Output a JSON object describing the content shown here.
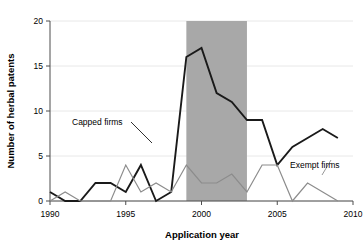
{
  "chart_data": {
    "type": "line",
    "title": "",
    "xlabel": "Application year",
    "ylabel": "Number of herbal patents",
    "xlim": [
      1990,
      2010
    ],
    "ylim": [
      0,
      20
    ],
    "xticks": [
      1990,
      1995,
      2000,
      2005,
      2010
    ],
    "yticks": [
      0,
      5,
      10,
      15,
      20
    ],
    "grid": true,
    "legend_position": "inline-annotations",
    "x": [
      1990,
      1991,
      1992,
      1993,
      1994,
      1995,
      1996,
      1997,
      1998,
      1999,
      2000,
      2001,
      2002,
      2003,
      2004,
      2005,
      2006,
      2007,
      2008,
      2009
    ],
    "series": [
      {
        "name": "Capped firms",
        "color": "#1a1a1a",
        "values": [
          1,
          0,
          0,
          2,
          2,
          1,
          4,
          0,
          1,
          16,
          17,
          12,
          11,
          9,
          9,
          4,
          6,
          7,
          8,
          7
        ]
      },
      {
        "name": "Exempt firms",
        "color": "#8c8c8c",
        "values": [
          0,
          1,
          0,
          0,
          0,
          4,
          1,
          2,
          1,
          4,
          2,
          2,
          3,
          1,
          4,
          4,
          0,
          2,
          1,
          0
        ]
      }
    ],
    "shaded_region": {
      "label": "",
      "x_start": 1999,
      "x_end": 2003,
      "color": "#a8a8a8"
    },
    "annotations": [
      {
        "text": "Capped firms",
        "x": 1994.0,
        "y": 7.6
      },
      {
        "text": "Exempt firms",
        "x": 2005.6,
        "y": 4.6
      }
    ]
  },
  "axis": {
    "xlabel": "Application year",
    "ylabel": "Number of herbal patents",
    "xtick_labels": [
      "1990",
      "1995",
      "2000",
      "2005",
      "2010"
    ],
    "ytick_labels": [
      "0",
      "5",
      "10",
      "15",
      "20"
    ]
  },
  "labels": {
    "capped": "Capped firms",
    "exempt": "Exempt firms"
  },
  "colors": {
    "capped_line": "#1a1a1a",
    "exempt_line": "#8c8c8c",
    "shade": "#a8a8a8",
    "grid": "#e8e8e8",
    "axis": "#4d4d4d"
  }
}
